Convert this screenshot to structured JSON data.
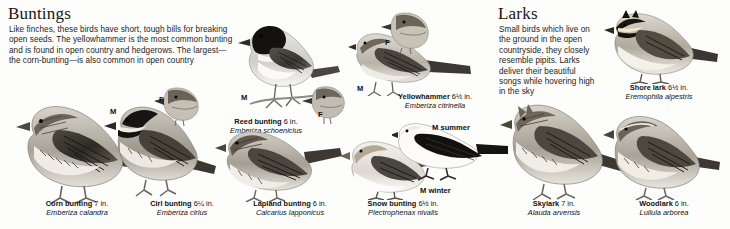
{
  "page": {
    "background": "#fdfdfc",
    "ink": "#111111"
  },
  "sections": [
    {
      "id": "buntings",
      "title": "Buntings",
      "intro": "Like finches, these birds have short, tough bills for breaking open seeds. The yellowhammer is the most common bunting and is found in open country and hedgerows. The largest—the corn-bunting—is also common in open country"
    },
    {
      "id": "larks",
      "title": "Larks",
      "intro": "Small birds which live on the ground in the open countryside, they closely resemble pipits. Larks deliver their beautiful songs while hovering high in the sky"
    }
  ],
  "species": [
    {
      "key": "corn-bunting",
      "common": "Corn bunting",
      "size": "7 in.",
      "latin": "Emberiza calandra"
    },
    {
      "key": "cirl-bunting",
      "common": "Cirl bunting",
      "size": "6¼ in.",
      "latin": "Emberiza cirlus"
    },
    {
      "key": "lapland-bunting",
      "common": "Lapland bunting",
      "size": "6 in.",
      "latin": "Calcarius lapponicus"
    },
    {
      "key": "snow-bunting",
      "common": "Snow bunting",
      "size": "6½ in.",
      "latin": "Plectrophenax nivalis"
    },
    {
      "key": "reed-bunting",
      "common": "Reed bunting",
      "size": "6 in.",
      "latin": "Emberiza schoeniclus"
    },
    {
      "key": "yellowhammer",
      "common": "Yellowhammer",
      "size": "6½ in.",
      "latin": "Emberiza citrinella"
    },
    {
      "key": "shore-lark",
      "common": "Shore lark",
      "size": "6½ in.",
      "latin": "Eremophila alpestris"
    },
    {
      "key": "skylark",
      "common": "Skylark",
      "size": "7 in.",
      "latin": "Alauda arvensis"
    },
    {
      "key": "woodlark",
      "common": "Woodlark",
      "size": "6 in.",
      "latin": "Lullula arborea"
    }
  ],
  "markers": {
    "cirl_male": "M",
    "cirl_female": "F",
    "reed_male": "M",
    "reed_female": "F",
    "yellowhammer_male": "M",
    "yellowhammer_female": "F",
    "snow_male_summer": "M summer",
    "snow_male_winter": "M winter"
  }
}
